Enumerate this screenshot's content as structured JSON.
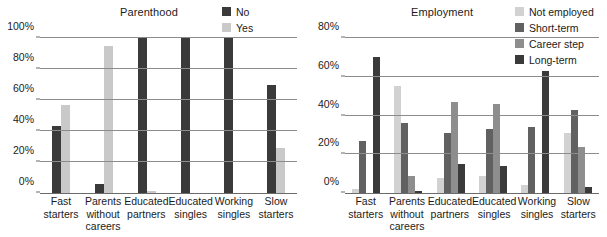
{
  "charts": [
    {
      "id": "parenthood",
      "title": "Parenthood",
      "legend": [
        {
          "label": "No",
          "color": "#3a3a3a"
        },
        {
          "label": "Yes",
          "color": "#c9c9c9"
        }
      ],
      "yticks": [
        "0%",
        "20%",
        "40%",
        "60%",
        "80%",
        "100%"
      ],
      "categories": [
        "Fast\nstarters",
        "Parents\nwithout\ncareers",
        "Educated\npartners",
        "Educated\nsingles",
        "Working\nsingles",
        "Slow\nstarters"
      ]
    },
    {
      "id": "employment",
      "title": "Employment",
      "legend": [
        {
          "label": "Not employed",
          "color": "#d2d2d2"
        },
        {
          "label": "Short-term",
          "color": "#616161"
        },
        {
          "label": "Career step",
          "color": "#8e8e8e"
        },
        {
          "label": "Long-term",
          "color": "#3a3a3a"
        }
      ],
      "yticks": [
        "0%",
        "20%",
        "40%",
        "60%",
        "80%"
      ],
      "categories": [
        "Fast\nstarters",
        "Parents\nwithout\ncareers",
        "Educated\npartners",
        "Educated\nsingles",
        "Working\nsingles",
        "Slow\nstarters"
      ]
    }
  ],
  "chart_data": [
    {
      "type": "bar",
      "title": "Parenthood",
      "xlabel": "",
      "ylabel": "",
      "ylim": [
        0,
        100
      ],
      "yticks": [
        0,
        20,
        40,
        60,
        80,
        100
      ],
      "grid": true,
      "legend_position": "top-right",
      "categories": [
        "Fast starters",
        "Parents without careers",
        "Educated partners",
        "Educated singles",
        "Working singles",
        "Slow starters"
      ],
      "series": [
        {
          "name": "No",
          "color": "#3a3a3a",
          "values": [
            43,
            6,
            100,
            100,
            100,
            70
          ]
        },
        {
          "name": "Yes",
          "color": "#c9c9c9",
          "values": [
            57,
            95,
            1,
            0,
            0,
            29
          ]
        }
      ]
    },
    {
      "type": "bar",
      "title": "Employment",
      "xlabel": "",
      "ylabel": "",
      "ylim": [
        0,
        80
      ],
      "yticks": [
        0,
        20,
        40,
        60,
        80
      ],
      "grid": true,
      "legend_position": "top-right",
      "categories": [
        "Fast starters",
        "Parents without careers",
        "Educated partners",
        "Educated singles",
        "Working singles",
        "Slow starters"
      ],
      "series": [
        {
          "name": "Not employed",
          "color": "#d2d2d2",
          "values": [
            2,
            55,
            8,
            9,
            4,
            31
          ]
        },
        {
          "name": "Short-term",
          "color": "#616161",
          "values": [
            27,
            36,
            31,
            33,
            34,
            43
          ]
        },
        {
          "name": "Career step",
          "color": "#8e8e8e",
          "values": [
            0,
            9,
            47,
            46,
            0,
            24
          ]
        },
        {
          "name": "Long-term",
          "color": "#3a3a3a",
          "values": [
            70,
            1,
            15,
            14,
            63,
            3
          ]
        }
      ]
    }
  ]
}
